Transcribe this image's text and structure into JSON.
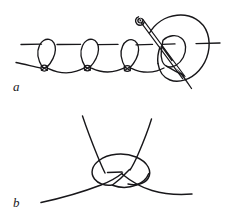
{
  "figure": {
    "background_color": "#ffffff",
    "ink_color": "#18171a",
    "width": 231,
    "height": 219,
    "style": "pen-and-ink line drawing"
  },
  "panels": [
    {
      "id": "a",
      "label": "a",
      "caption_position": "bottom-left",
      "description": "Row of blanket-stitch loops along a horizontal ground thread with a threaded needle forming the last loop",
      "elements": {
        "ground_line_label": "horizontal ground thread",
        "loop_count": 3,
        "knot_count": 3,
        "needle_label": "threaded sewing needle",
        "needle_eye_label": "needle eye",
        "working_loop_label": "large working loop"
      }
    },
    {
      "id": "b",
      "label": "b",
      "caption_position": "bottom-left",
      "description": "Enlarged detail of a single tightened overhand crossing knot with two upward strands and two outward tails",
      "elements": {
        "strand_count": 2,
        "tail_count": 2,
        "crossing_label": "knot crossing"
      }
    }
  ],
  "labels": {
    "panel_a": "a",
    "panel_b": "b"
  }
}
